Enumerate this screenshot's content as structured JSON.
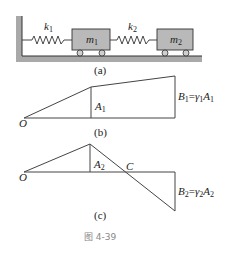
{
  "figure": {
    "caption": "图 4-39",
    "panel_a": {
      "label": "(a)",
      "springs": [
        {
          "name": "k",
          "sub": "1"
        },
        {
          "name": "k",
          "sub": "2"
        }
      ],
      "masses": [
        {
          "name": "m",
          "sub": "1"
        },
        {
          "name": "m",
          "sub": "2"
        }
      ]
    },
    "panel_b": {
      "label": "(b)",
      "origin": "O",
      "amplitude": {
        "name": "A",
        "sub": "1"
      },
      "end_value": {
        "lhs": "B",
        "lhs_sub": "1",
        "eq": "=",
        "gamma": "γ",
        "gamma_sub": "1",
        "rhs": "A",
        "rhs_sub": "1"
      }
    },
    "panel_c": {
      "label": "(c)",
      "origin": "O",
      "node": "C",
      "amplitude": {
        "name": "A",
        "sub": "2"
      },
      "end_value": {
        "lhs": "B",
        "lhs_sub": "2",
        "eq": "=",
        "gamma": "γ",
        "gamma_sub": "2",
        "rhs": "A",
        "rhs_sub": "2"
      }
    },
    "colors": {
      "block": "#b9b9b9",
      "ground": "#a9a9a9",
      "line": "#333333"
    }
  }
}
